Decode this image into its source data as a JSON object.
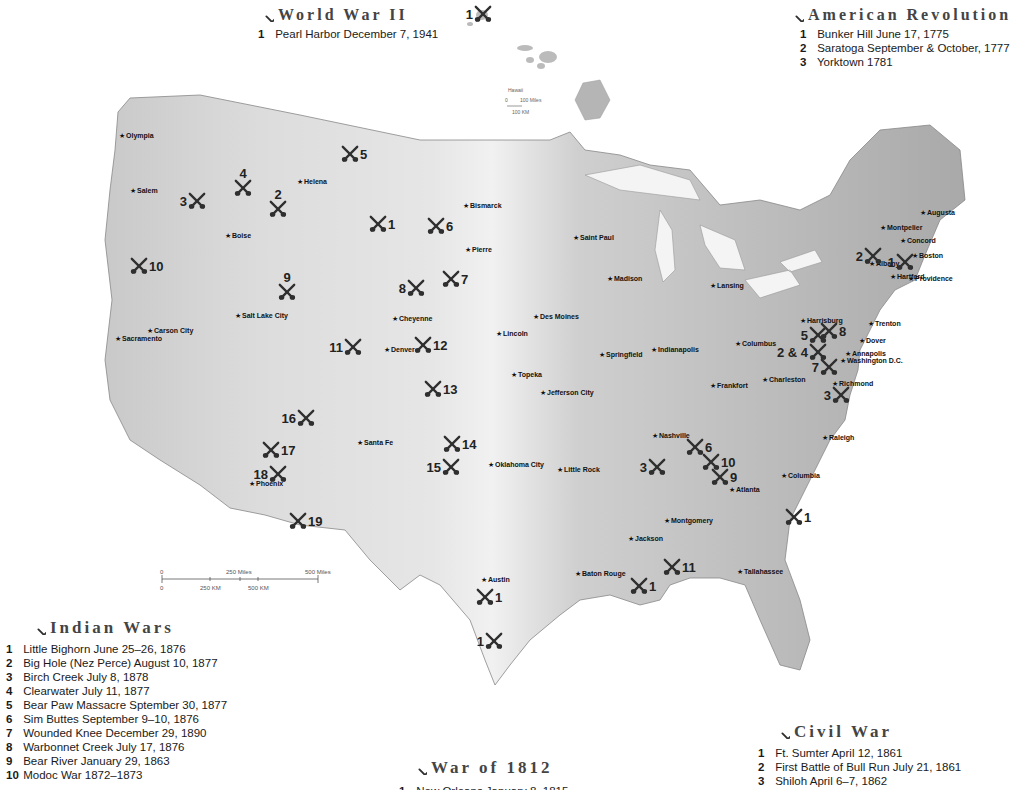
{
  "legends": {
    "world_war_ii": {
      "title": "World War II",
      "items": [
        {
          "num": "1",
          "text": "Pearl Harbor December 7, 1941"
        }
      ]
    },
    "american_revolution": {
      "title": "American Revolution",
      "items": [
        {
          "num": "1",
          "text": "Bunker Hill June 17, 1775"
        },
        {
          "num": "2",
          "text": "Saratoga September & October, 1777"
        },
        {
          "num": "3",
          "text": "Yorktown 1781"
        }
      ]
    },
    "indian_wars": {
      "title": "Indian Wars",
      "items": [
        {
          "num": "1",
          "text": "Little Bighorn June 25–26, 1876"
        },
        {
          "num": "2",
          "text": "Big Hole (Nez Perce) August 10, 1877"
        },
        {
          "num": "3",
          "text": "Birch Creek July 8, 1878"
        },
        {
          "num": "4",
          "text": "Clearwater July 11, 1877"
        },
        {
          "num": "5",
          "text": "Bear Paw Massacre Sptember 30, 1877"
        },
        {
          "num": "6",
          "text": "Sim Buttes September 9–10, 1876"
        },
        {
          "num": "7",
          "text": "Wounded Knee December 29, 1890"
        },
        {
          "num": "8",
          "text": "Warbonnet Creek July 17, 1876"
        },
        {
          "num": "9",
          "text": "Bear River January 29, 1863"
        },
        {
          "num": "10",
          "text": "Modoc War 1872–1873"
        }
      ]
    },
    "war_of_1812": {
      "title": "War of 1812",
      "items": [
        {
          "num": "1",
          "text": "New Orleans January 8, 1815"
        }
      ]
    },
    "civil_war": {
      "title": "Civil War",
      "items": [
        {
          "num": "1",
          "text": "Ft. Sumter April 12, 1861"
        },
        {
          "num": "2",
          "text": "First Battle of Bull Run July 21, 1861"
        },
        {
          "num": "3",
          "text": "Shiloh April 6–7, 1862"
        }
      ]
    }
  },
  "hawaii": {
    "label": "Hawaii",
    "islands": [
      "Kauai",
      "Niihau",
      "Oahu",
      "Molokai",
      "Lanai",
      "Maui",
      "Kahoolawe",
      "Hawaii"
    ],
    "scale_miles": "100 Miles",
    "scale_km": "100 KM",
    "scale_zero": "0"
  },
  "scale_bar": {
    "zero": "0",
    "miles_250": "250 Miles",
    "miles_500": "500 Miles",
    "km_250": "250 KM",
    "km_500": "500 KM"
  },
  "states": [
    "Washington",
    "Oregon",
    "California",
    "Idaho",
    "Nevada",
    "Montana",
    "Wyoming",
    "Utah",
    "Arizona",
    "Colorado",
    "New Mexico",
    "North Dakota",
    "South Dakota",
    "Nebraska",
    "Kansas",
    "Oklahoma",
    "Texas",
    "Minnesota",
    "Iowa",
    "Missouri",
    "Arkansas",
    "Louisiana",
    "Wisconsin",
    "Illinois",
    "Michigan",
    "Indiana",
    "Ohio",
    "Kentucky",
    "Tennessee",
    "Mississippi",
    "Alabama",
    "Georgia",
    "Florida",
    "South Carolina",
    "North Carolina",
    "Virginia",
    "West Virginia",
    "Pennsylvania",
    "New York",
    "Maryland",
    "Delaware",
    "New Jersey",
    "Vermont",
    "New Hampshire",
    "Maine",
    "Massachusetts",
    "Rhode Island",
    "Connecticut"
  ],
  "cities": [
    {
      "name": "Olympia",
      "x": 122,
      "y": 136
    },
    {
      "name": "Salem",
      "x": 133,
      "y": 191
    },
    {
      "name": "Helena",
      "x": 300,
      "y": 182
    },
    {
      "name": "Boise",
      "x": 228,
      "y": 236
    },
    {
      "name": "Salt Lake City",
      "x": 238,
      "y": 316
    },
    {
      "name": "Carson City",
      "x": 150,
      "y": 331
    },
    {
      "name": "Sacramento",
      "x": 118,
      "y": 339
    },
    {
      "name": "Cheyenne",
      "x": 395,
      "y": 319
    },
    {
      "name": "Denver",
      "x": 387,
      "y": 350
    },
    {
      "name": "Bismarck",
      "x": 466,
      "y": 206
    },
    {
      "name": "Pierre",
      "x": 468,
      "y": 250
    },
    {
      "name": "Saint Paul",
      "x": 576,
      "y": 238
    },
    {
      "name": "Madison",
      "x": 610,
      "y": 279
    },
    {
      "name": "Lansing",
      "x": 713,
      "y": 286
    },
    {
      "name": "Des Moines",
      "x": 536,
      "y": 317
    },
    {
      "name": "Lincoln",
      "x": 499,
      "y": 334
    },
    {
      "name": "Topeka",
      "x": 514,
      "y": 375
    },
    {
      "name": "Springfield",
      "x": 602,
      "y": 355
    },
    {
      "name": "Indianapolis",
      "x": 654,
      "y": 350
    },
    {
      "name": "Columbus",
      "x": 738,
      "y": 344
    },
    {
      "name": "Jefferson City",
      "x": 543,
      "y": 393
    },
    {
      "name": "Frankfort",
      "x": 713,
      "y": 386
    },
    {
      "name": "Charleston",
      "x": 765,
      "y": 380
    },
    {
      "name": "Nashville",
      "x": 655,
      "y": 436
    },
    {
      "name": "Oklahoma City",
      "x": 491,
      "y": 465
    },
    {
      "name": "Little Rock",
      "x": 560,
      "y": 470
    },
    {
      "name": "Santa Fe",
      "x": 360,
      "y": 443
    },
    {
      "name": "Phoenix",
      "x": 252,
      "y": 484
    },
    {
      "name": "Atlanta",
      "x": 732,
      "y": 490
    },
    {
      "name": "Columbia",
      "x": 784,
      "y": 476
    },
    {
      "name": "Raleigh",
      "x": 825,
      "y": 438
    },
    {
      "name": "Richmond",
      "x": 835,
      "y": 384
    },
    {
      "name": "Montgomery",
      "x": 667,
      "y": 521
    },
    {
      "name": "Jackson",
      "x": 631,
      "y": 539
    },
    {
      "name": "Baton Rouge",
      "x": 578,
      "y": 574
    },
    {
      "name": "Tallahassee",
      "x": 740,
      "y": 572
    },
    {
      "name": "Austin",
      "x": 484,
      "y": 580
    },
    {
      "name": "Harrisburg",
      "x": 803,
      "y": 321
    },
    {
      "name": "Trenton",
      "x": 871,
      "y": 324
    },
    {
      "name": "Dover",
      "x": 862,
      "y": 341
    },
    {
      "name": "Annapolis",
      "x": 848,
      "y": 354
    },
    {
      "name": "Washington D.C.",
      "x": 843,
      "y": 361
    },
    {
      "name": "Albany",
      "x": 872,
      "y": 264
    },
    {
      "name": "Hartford",
      "x": 893,
      "y": 277
    },
    {
      "name": "Providence",
      "x": 911,
      "y": 279
    },
    {
      "name": "Boston",
      "x": 915,
      "y": 256
    },
    {
      "name": "Concord",
      "x": 903,
      "y": 241
    },
    {
      "name": "Montpelier",
      "x": 883,
      "y": 228
    },
    {
      "name": "Augusta",
      "x": 923,
      "y": 213
    }
  ],
  "markers": [
    {
      "label": "1",
      "x": 483,
      "y": 14,
      "num_side": "left",
      "war": "World War II"
    },
    {
      "label": "1",
      "x": 905,
      "y": 262,
      "num_side": "left",
      "war": "American Revolution"
    },
    {
      "label": "2",
      "x": 873,
      "y": 256,
      "num_side": "left",
      "war": "American Revolution"
    },
    {
      "label": "3",
      "x": 841,
      "y": 395,
      "num_side": "left",
      "war": "American Revolution"
    },
    {
      "label": "1",
      "x": 378,
      "y": 224,
      "num_side": "right",
      "war": "Indian Wars"
    },
    {
      "label": "2",
      "x": 278,
      "y": 209,
      "num_side": "top",
      "war": "Indian Wars"
    },
    {
      "label": "3",
      "x": 197,
      "y": 201,
      "num_side": "left",
      "war": "Indian Wars"
    },
    {
      "label": "4",
      "x": 243,
      "y": 188,
      "num_side": "top",
      "war": "Indian Wars"
    },
    {
      "label": "5",
      "x": 350,
      "y": 154,
      "num_side": "right",
      "war": "Indian Wars"
    },
    {
      "label": "6",
      "x": 436,
      "y": 226,
      "num_side": "right",
      "war": "Indian Wars"
    },
    {
      "label": "7",
      "x": 451,
      "y": 279,
      "num_side": "right",
      "war": "Indian Wars"
    },
    {
      "label": "8",
      "x": 416,
      "y": 288,
      "num_side": "left",
      "war": "Indian Wars"
    },
    {
      "label": "9",
      "x": 287,
      "y": 292,
      "num_side": "top",
      "war": "Indian Wars"
    },
    {
      "label": "10",
      "x": 139,
      "y": 266,
      "num_side": "right",
      "war": "Indian Wars"
    },
    {
      "label": "11",
      "x": 353,
      "y": 347,
      "num_side": "left",
      "war": "Indian Wars"
    },
    {
      "label": "12",
      "x": 423,
      "y": 345,
      "num_side": "right",
      "war": "Indian Wars"
    },
    {
      "label": "13",
      "x": 433,
      "y": 389,
      "num_side": "right",
      "war": "Indian Wars"
    },
    {
      "label": "14",
      "x": 452,
      "y": 444,
      "num_side": "right",
      "war": "Indian Wars"
    },
    {
      "label": "15",
      "x": 451,
      "y": 467,
      "num_side": "left",
      "war": "Indian Wars"
    },
    {
      "label": "16",
      "x": 306,
      "y": 418,
      "num_side": "left",
      "war": "Indian Wars"
    },
    {
      "label": "17",
      "x": 271,
      "y": 450,
      "num_side": "right",
      "war": "Indian Wars"
    },
    {
      "label": "18",
      "x": 278,
      "y": 474,
      "num_side": "left",
      "war": "Indian Wars"
    },
    {
      "label": "19",
      "x": 298,
      "y": 521,
      "num_side": "right",
      "war": "Indian Wars"
    },
    {
      "label": "1",
      "x": 639,
      "y": 586,
      "num_side": "right",
      "war": "War of 1812"
    },
    {
      "label": "1",
      "x": 485,
      "y": 597,
      "num_side": "right",
      "war": "Texas"
    },
    {
      "label": "1",
      "x": 494,
      "y": 641,
      "num_side": "left",
      "war": "Texas"
    },
    {
      "label": "1",
      "x": 794,
      "y": 517,
      "num_side": "right",
      "war": "Civil War"
    },
    {
      "label": "2 & 4",
      "x": 818,
      "y": 352,
      "num_side": "left",
      "war": "Civil War"
    },
    {
      "label": "3",
      "x": 657,
      "y": 467,
      "num_side": "left",
      "war": "Civil War"
    },
    {
      "label": "5",
      "x": 818,
      "y": 335,
      "num_side": "left",
      "war": "Civil War"
    },
    {
      "label": "6",
      "x": 695,
      "y": 447,
      "num_side": "right",
      "war": "Civil War"
    },
    {
      "label": "7",
      "x": 829,
      "y": 367,
      "num_side": "left",
      "war": "Civil War"
    },
    {
      "label": "8",
      "x": 829,
      "y": 331,
      "num_side": "right",
      "war": "Civil War"
    },
    {
      "label": "9",
      "x": 720,
      "y": 477,
      "num_side": "right",
      "war": "Civil War"
    },
    {
      "label": "10",
      "x": 711,
      "y": 462,
      "num_side": "right",
      "war": "Civil War"
    },
    {
      "label": "11",
      "x": 672,
      "y": 567,
      "num_side": "right",
      "war": "Civil War"
    }
  ]
}
